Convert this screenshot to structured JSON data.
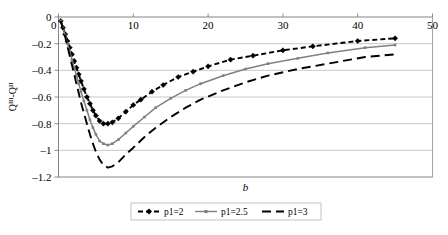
{
  "chart_data": {
    "type": "line",
    "title": "",
    "xlabel": "b",
    "ylabel": "QIII-QII",
    "ylabel_base1": "Q",
    "ylabel_sup1": "III",
    "ylabel_dash": "-",
    "ylabel_base2": "Q",
    "ylabel_sup2": "II",
    "xlim": [
      0,
      50
    ],
    "ylim": [
      -1.2,
      0
    ],
    "xticks": [
      0,
      10,
      20,
      30,
      40,
      50
    ],
    "xtick_labels": [
      "0",
      "10",
      "20",
      "30",
      "40",
      "50"
    ],
    "yticks": [
      0,
      -0.2,
      -0.4,
      -0.6,
      -0.8,
      -1,
      -1.2
    ],
    "ytick_labels": [
      "0",
      "–0.2",
      "–0.4",
      "–0.6",
      "–0.8",
      "–1",
      "–1.2"
    ],
    "grid": true,
    "grid_axis": "y",
    "xaxis_position": "top",
    "legend_position": "bottom",
    "series": [
      {
        "name": "p1=2",
        "color": "#000000",
        "style": "dashed",
        "marker": "diamond",
        "x": [
          0.3,
          0.6,
          0.9,
          1.2,
          1.5,
          1.8,
          2.1,
          2.4,
          2.7,
          3.0,
          3.4,
          3.8,
          4.2,
          4.6,
          5.0,
          5.5,
          6.0,
          6.6,
          7.2,
          8.0,
          9.0,
          10.0,
          11.0,
          12.5,
          14.0,
          16.0,
          18.0,
          20.0,
          23.0,
          26.0,
          30.0,
          34.0,
          40.0,
          45.0
        ],
        "y": [
          -0.03,
          -0.08,
          -0.13,
          -0.18,
          -0.23,
          -0.28,
          -0.33,
          -0.38,
          -0.43,
          -0.48,
          -0.54,
          -0.6,
          -0.65,
          -0.7,
          -0.74,
          -0.78,
          -0.8,
          -0.8,
          -0.79,
          -0.76,
          -0.71,
          -0.66,
          -0.62,
          -0.56,
          -0.51,
          -0.45,
          -0.41,
          -0.37,
          -0.32,
          -0.29,
          -0.25,
          -0.22,
          -0.18,
          -0.16
        ]
      },
      {
        "name": "p1=2.5",
        "color": "#808080",
        "style": "solid",
        "marker": "dot",
        "x": [
          0.3,
          0.6,
          0.9,
          1.2,
          1.5,
          1.8,
          2.1,
          2.4,
          2.7,
          3.0,
          3.4,
          3.8,
          4.2,
          4.6,
          5.0,
          5.5,
          6.0,
          6.6,
          7.2,
          8.0,
          9.0,
          10.0,
          11.5,
          13.0,
          15.0,
          17.0,
          19.0,
          22.0,
          25.0,
          28.0,
          32.0,
          36.0,
          41.0,
          45.0
        ],
        "y": [
          -0.03,
          -0.08,
          -0.14,
          -0.2,
          -0.26,
          -0.32,
          -0.38,
          -0.44,
          -0.5,
          -0.56,
          -0.63,
          -0.7,
          -0.77,
          -0.83,
          -0.88,
          -0.93,
          -0.95,
          -0.96,
          -0.95,
          -0.92,
          -0.87,
          -0.82,
          -0.75,
          -0.68,
          -0.61,
          -0.55,
          -0.5,
          -0.44,
          -0.39,
          -0.35,
          -0.31,
          -0.27,
          -0.23,
          -0.21
        ]
      },
      {
        "name": "p1=3",
        "color": "#000000",
        "style": "longdash",
        "marker": "none",
        "x": [
          0.3,
          0.6,
          0.9,
          1.2,
          1.5,
          1.8,
          2.1,
          2.4,
          2.7,
          3.0,
          3.4,
          3.8,
          4.2,
          4.6,
          5.0,
          5.5,
          6.0,
          6.6,
          7.2,
          8.0,
          9.0,
          10.0,
          11.5,
          13.0,
          15.0,
          17.0,
          19.0,
          22.0,
          25.0,
          28.0,
          32.0,
          36.0,
          41.0,
          45.0
        ],
        "y": [
          -0.03,
          -0.09,
          -0.15,
          -0.22,
          -0.29,
          -0.36,
          -0.43,
          -0.5,
          -0.57,
          -0.64,
          -0.72,
          -0.8,
          -0.88,
          -0.95,
          -1.01,
          -1.07,
          -1.11,
          -1.13,
          -1.12,
          -1.09,
          -1.03,
          -0.98,
          -0.9,
          -0.83,
          -0.75,
          -0.68,
          -0.62,
          -0.55,
          -0.49,
          -0.44,
          -0.39,
          -0.35,
          -0.3,
          -0.28
        ]
      }
    ]
  },
  "legend": {
    "entries": [
      {
        "label": "p1=2"
      },
      {
        "label": "p1=2.5"
      },
      {
        "label": "p1=3"
      }
    ]
  }
}
